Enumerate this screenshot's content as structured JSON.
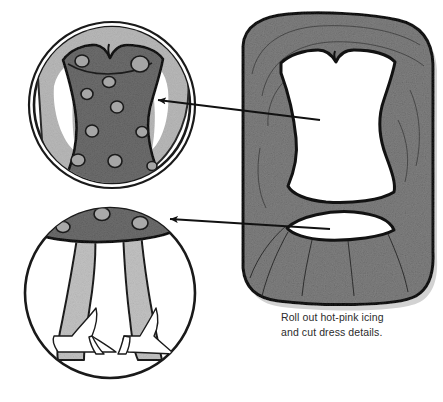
{
  "page": {
    "width": 443,
    "height": 402,
    "background": "#ffffff",
    "kind": "instructional-illustration"
  },
  "caption": {
    "line1": "Roll out hot-pink icing",
    "line2": "and cut dress details.",
    "full_text": "Roll out hot-pink icing\nand cut dress details.",
    "color": "#2b2b2b"
  },
  "palette": {
    "outline": "#1a1a1a",
    "icing_sheet_grey": "#808080",
    "icing_sheet_grey_dark": "#6f6f6f",
    "detail_dress_dark": "#6e6e6e",
    "detail_icing_light": "#b9b9b9",
    "detail_leg_light": "#c2c2c2",
    "white": "#ffffff",
    "arrow": "#111111",
    "shadow": "#cfcfcf"
  },
  "figures": {
    "icing_sheet": {
      "name": "rolled-icing-sheet",
      "description": "Large rounded rectangular sheet of rolled-out icing, shaded grey, with a corset/bodice shape cut out of the upper area and a crescent/lens shape cut out below it.",
      "cut_shapes": [
        {
          "name": "bodice-cutout",
          "shape": "corset-bodice"
        },
        {
          "name": "crescent-cutout",
          "shape": "lens-crescent"
        }
      ]
    },
    "detail_top": {
      "name": "bodice-detail-circle",
      "description": "Magnified circular detail showing the polka-dotted dress bodice placed on the cake.",
      "dots": 10
    },
    "detail_bottom": {
      "name": "skirt-legs-detail-circle",
      "description": "Magnified circular detail showing the polka-dotted skirt hem band with two legs and high-heeled shoes below.",
      "dots": 3,
      "shoes": 2
    }
  },
  "arrows": [
    {
      "name": "arrow-bodice",
      "from": "bodice-cutout",
      "to": "bodice-detail-circle",
      "direction": "right-to-left"
    },
    {
      "name": "arrow-crescent",
      "from": "crescent-cutout",
      "to": "skirt-legs-detail-circle",
      "direction": "right-to-left"
    }
  ]
}
